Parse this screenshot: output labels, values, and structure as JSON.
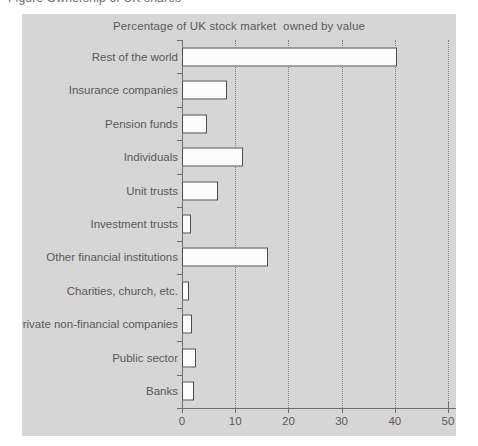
{
  "top_sliver": {
    "text": "Figure   Ownership of UK shares"
  },
  "chart_data": {
    "type": "bar",
    "orientation": "horizontal",
    "title": "Percentage of UK stock market  owned by value",
    "xlabel": "",
    "ylabel": "",
    "xlim": [
      0,
      50
    ],
    "xticks": [
      0,
      10,
      20,
      30,
      40,
      50
    ],
    "xtick_labels": [
      "0",
      "10",
      "20",
      "30",
      "40",
      "50"
    ],
    "grid": "vertical-dotted",
    "legend": "none",
    "bar_fill_color": "#fbfbfb",
    "bar_edge_color": "#4d4d4d",
    "panel_color": "#d6d6d6",
    "text_color": "#595959",
    "categories": [
      "Rest of the world",
      "Insurance companies",
      "Pension funds",
      "Individuals",
      "Unit trusts",
      "Investment trusts",
      "Other financial institutions",
      "Charities, church, etc.",
      "Private non-financial companies",
      "Public sector",
      "Banks"
    ],
    "values": [
      40.5,
      8.4,
      4.7,
      11.5,
      6.8,
      1.7,
      16.2,
      1.3,
      1.9,
      2.6,
      2.3
    ]
  }
}
